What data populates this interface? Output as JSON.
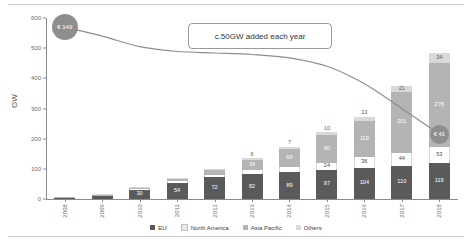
{
  "chart_data": {
    "type": "bar",
    "title": "",
    "xlabel": "",
    "ylabel": "GW",
    "ylim": [
      0,
      600
    ],
    "yticks": [
      0,
      100,
      200,
      300,
      400,
      500,
      600
    ],
    "grid": false,
    "stacked": true,
    "categories": [
      "2008",
      "2009",
      "2010",
      "2011",
      "2012",
      "2013",
      "2014",
      "2015",
      "2016",
      "2017",
      "2018"
    ],
    "series": [
      {
        "name": "EU",
        "color": "#5a5a5a",
        "values": [
          5,
          11,
          30,
          54,
          72,
          82,
          89,
          97,
          104,
          110,
          119
        ]
      },
      {
        "name": "North America",
        "color": "#ffffff",
        "values": [
          1,
          2,
          3,
          5,
          8,
          13,
          17,
          24,
          36,
          44,
          53
        ]
      },
      {
        "name": "Asia Pacific",
        "color": "#b4b4b4",
        "values": [
          1,
          2,
          4,
          9,
          16,
          34,
          60,
          90,
          119,
          201,
          278
        ]
      },
      {
        "name": "Others",
        "color": "#d8d8d8",
        "values": [
          0,
          1,
          2,
          3,
          4,
          6,
          7,
          10,
          13,
          21,
          34
        ]
      }
    ],
    "bar_labels": {
      "2008": {
        "EU": "",
        "North America": "",
        "Asia Pacific": "",
        "Others": ""
      },
      "2009": {
        "EU": "",
        "North America": "",
        "Asia Pacific": "",
        "Others": ""
      },
      "2010": {
        "EU": "30",
        "North America": "",
        "Asia Pacific": "",
        "Others": ""
      },
      "2011": {
        "EU": "54",
        "North America": "",
        "Asia Pacific": "",
        "Others": ""
      },
      "2012": {
        "EU": "72",
        "North America": "",
        "Asia Pacific": "",
        "Others": ""
      },
      "2013": {
        "EU": "82",
        "North America": "13",
        "Asia Pacific": "34",
        "Others": "6"
      },
      "2014": {
        "EU": "89",
        "North America": "17",
        "Asia Pacific": "60",
        "Others": "7"
      },
      "2015": {
        "EU": "97",
        "North America": "24",
        "Asia Pacific": "90",
        "Others": "10"
      },
      "2016": {
        "EU": "104",
        "North America": "36",
        "Asia Pacific": "119",
        "Others": "13"
      },
      "2017": {
        "EU": "110",
        "North America": "44",
        "Asia Pacific": "201",
        "Others": "21"
      },
      "2018": {
        "EU": "119",
        "North America": "53",
        "Asia Pacific": "278",
        "Others": "34"
      }
    },
    "cost_curve": {
      "name": "Cost per unit",
      "color": "#8e8e8e",
      "points": [
        {
          "x": "2008",
          "y": 570
        },
        {
          "x": "2009",
          "y": 540
        },
        {
          "x": "2010",
          "y": 505
        },
        {
          "x": "2011",
          "y": 489
        },
        {
          "x": "2012",
          "y": 484
        },
        {
          "x": "2013",
          "y": 479
        },
        {
          "x": "2014",
          "y": 468
        },
        {
          "x": "2015",
          "y": 440
        },
        {
          "x": "2016",
          "y": 382
        },
        {
          "x": "2017",
          "y": 300
        },
        {
          "x": "2018",
          "y": 215
        }
      ],
      "start_marker": "€ 149",
      "end_marker": "€ 43"
    },
    "annotation": "c.50GW added each year"
  },
  "axis": {
    "y_label": "GW",
    "y_ticks": [
      "600",
      "500",
      "400",
      "300",
      "200",
      "100",
      "0"
    ],
    "x_categories": [
      "2008",
      "2009",
      "2010",
      "2011",
      "2012",
      "2013",
      "2014",
      "2015",
      "2016",
      "2017",
      "2018"
    ]
  },
  "legend": {
    "items": [
      {
        "label": "EU",
        "color": "#5a5a5a"
      },
      {
        "label": "North America",
        "color": "#e8e8e8"
      },
      {
        "label": "Asia Pacific",
        "color": "#b4b4b4"
      },
      {
        "label": "Others",
        "color": "#d8d8d8"
      }
    ]
  },
  "annotation": {
    "text": "c.50GW added each year"
  },
  "markers": {
    "start": "€ 149",
    "end": "€ 43"
  }
}
